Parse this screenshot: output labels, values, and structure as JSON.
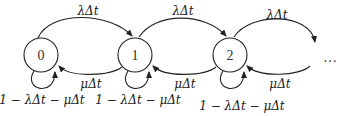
{
  "diagram": {
    "type": "birth-death markov chain",
    "nodes": [
      {
        "id": "0",
        "label": "0"
      },
      {
        "id": "1",
        "label": "1"
      },
      {
        "id": "2",
        "label": "2"
      }
    ],
    "ellipsis": "…",
    "edges": {
      "forward_label": "λΔt",
      "backward_label": "μΔt",
      "self_loop_label": "1 − λΔt − μΔt"
    },
    "labels": {
      "fwd_0_1": "λΔt",
      "fwd_1_2": "λΔt",
      "fwd_2_more": "λΔt",
      "back_1_0": "μΔt",
      "back_2_1": "μΔt",
      "back_more_2": "μΔt",
      "self_0": "1 − λΔt − μΔt",
      "self_1": "1 − λΔt − μΔt",
      "self_2": "1 − λΔt − μΔt"
    }
  }
}
